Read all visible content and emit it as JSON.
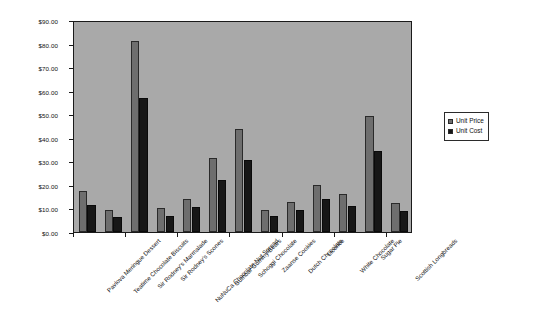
{
  "chart_data": {
    "type": "bar",
    "title": "",
    "subtitle": "",
    "xlabel": "",
    "ylabel": "",
    "ylim": [
      0,
      90
    ],
    "ytick_step": 10,
    "ytick_labels": [
      "$0.00",
      "$10.00",
      "$20.00",
      "$30.00",
      "$40.00",
      "$50.00",
      "$60.00",
      "$70.00",
      "$80.00",
      "$90.00"
    ],
    "grid": false,
    "legend_position": "right",
    "categories": [
      "Pavlova Meringue Dessert",
      "Teatime Chocolate Biscuits",
      "Sir Rodney's Marmalade",
      "Sir Rodney's Scones",
      "NuNuCa Chocolate-Nut Spread",
      "Gumbar Gummy Bears",
      "Schoggi Chocolate",
      "Zaanse Cookies",
      "Dutch Chocolate",
      "Licorice",
      "White Chocolate",
      "Sugar Pie",
      "Scottish Longbreads"
    ],
    "series": [
      {
        "name": "Unit Price",
        "color": "#6e6e6e",
        "values": [
          17.45,
          9.2,
          81.0,
          10.0,
          14.0,
          31.23,
          43.9,
          9.5,
          12.75,
          20.0,
          16.25,
          49.3,
          12.5
        ]
      },
      {
        "name": "Unit Cost",
        "color": "#171717",
        "values": [
          11.5,
          6.5,
          57.0,
          7.0,
          10.5,
          22.0,
          30.5,
          7.0,
          9.5,
          14.0,
          11.0,
          34.5,
          9.0
        ]
      }
    ]
  },
  "legend": {
    "entries": [
      {
        "label": "Unit Price"
      },
      {
        "label": "Unit Cost"
      }
    ]
  },
  "colors": {
    "plot_background": "#a9a9a9",
    "page_background": "#ffffff",
    "frame": "#1a1a1a",
    "series_price": "#6e6e6e",
    "series_cost": "#171717"
  }
}
